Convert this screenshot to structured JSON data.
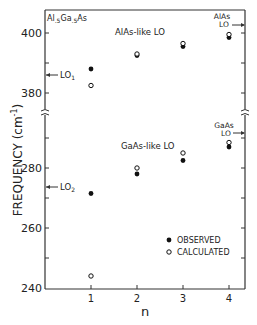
{
  "chart_data": {
    "type": "scatter",
    "title": "",
    "xlabel": "n",
    "ylabel": "FREQUENCY (cm⁻¹)",
    "categories": [
      1,
      2,
      3,
      4
    ],
    "x": [
      1,
      2,
      3,
      4
    ],
    "xticks": [
      "1",
      "2",
      "3",
      "4"
    ],
    "yticks": [
      "240",
      "260",
      "280",
      "380",
      "400"
    ],
    "ylim_lower": [
      240,
      292
    ],
    "ylim_upper": [
      374,
      404
    ],
    "axis_break": true,
    "grid": false,
    "legend_position": "lower right",
    "series": [
      {
        "name": "OBSERVED",
        "group": "AlAs-like LO",
        "marker": "filled-circle",
        "values": [
          388,
          392.5,
          395.5,
          398.5
        ]
      },
      {
        "name": "CALCULATED",
        "group": "AlAs-like LO",
        "marker": "open-circle",
        "values": [
          382.5,
          393,
          396.5,
          399.5
        ]
      },
      {
        "name": "OBSERVED",
        "group": "GaAs-like LO",
        "marker": "filled-circle",
        "values": [
          271.5,
          278,
          282.5,
          287
        ]
      },
      {
        "name": "CALCULATED",
        "group": "GaAs-like LO",
        "marker": "open-circle",
        "values": [
          244,
          280,
          285,
          288.5
        ]
      }
    ],
    "annotations": [
      {
        "text": "Al.5Ga.5As",
        "position": "top-left"
      },
      {
        "text": "AlAs-like LO",
        "position": "upper section"
      },
      {
        "text": "GaAs-like LO",
        "position": "lower section"
      },
      {
        "text": "LO1",
        "value": 386,
        "side": "left"
      },
      {
        "text": "LO2",
        "value": 273,
        "side": "left"
      },
      {
        "text": "AlAs LO",
        "value": 402,
        "side": "right"
      },
      {
        "text": "GaAs LO",
        "value": 290,
        "side": "right"
      }
    ]
  },
  "labels": {
    "composition": "Al",
    "composition_sub1": ".5",
    "composition_mid": "Ga",
    "composition_sub2": ".5",
    "composition_end": "As",
    "alas_like": "AlAs-like LO",
    "gaas_like": "GaAs-like LO",
    "lo1": "LO",
    "lo1_sub": "1",
    "lo2": "LO",
    "lo2_sub": "2",
    "alas_lo_line1": "AlAs",
    "alas_lo_line2": "LO",
    "gaas_lo_line1": "GaAs",
    "gaas_lo_line2": "LO",
    "legend_observed": "OBSERVED",
    "legend_calculated": "CALCULATED",
    "ylabel": "FREQUENCY (cm",
    "ylabel_sup": "-1",
    "ylabel_end": ")",
    "xlabel": "n",
    "ytick_400": "400",
    "ytick_380": "380",
    "ytick_280": "280",
    "ytick_260": "260",
    "ytick_240": "240",
    "xtick_1": "1",
    "xtick_2": "2",
    "xtick_3": "3",
    "xtick_4": "4"
  }
}
